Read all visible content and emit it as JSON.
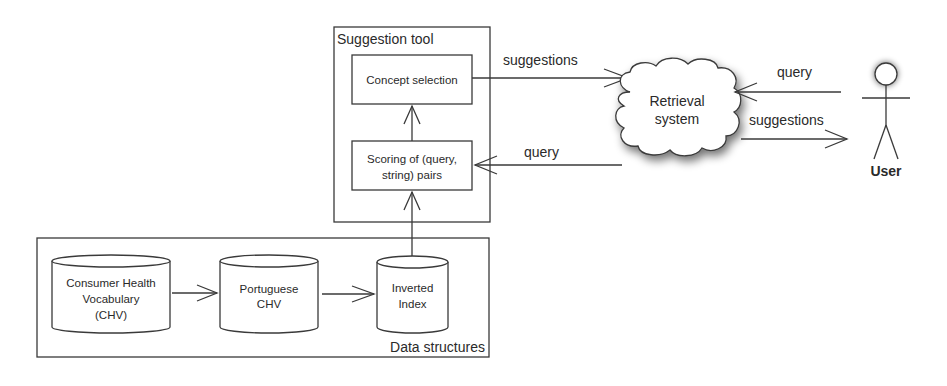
{
  "diagram": {
    "containers": {
      "suggestion_tool": "Suggestion tool",
      "data_structures": "Data structures"
    },
    "boxes": {
      "concept_selection": "Concept selection",
      "scoring_line1": "Scoring of (query,",
      "scoring_line2": "string) pairs"
    },
    "databases": {
      "chv_line1": "Consumer Health",
      "chv_line2": "Vocabulary",
      "chv_line3": "(CHV)",
      "pt_chv_line1": "Portuguese",
      "pt_chv_line2": "CHV",
      "inverted_line1": "Inverted",
      "inverted_line2": "Index"
    },
    "cloud": {
      "line1": "Retrieval",
      "line2": "system"
    },
    "actor": {
      "label": "User"
    },
    "arrows": {
      "tool_to_retrieval": "suggestions",
      "retrieval_to_tool": "query",
      "user_to_retrieval": "query",
      "retrieval_to_user": "suggestions"
    },
    "colors": {
      "stroke": "#3a3a3a",
      "text": "#2a2a2a",
      "background": "#ffffff"
    }
  }
}
